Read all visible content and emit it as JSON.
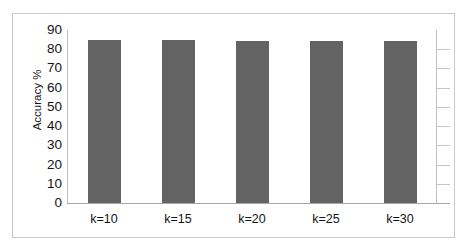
{
  "chart_data": {
    "type": "bar",
    "title": "",
    "xlabel": "",
    "ylabel": "Accuracy %",
    "categories": [
      "k=10",
      "k=15",
      "k=20",
      "k=25",
      "k=30"
    ],
    "values": [
      84.7,
      84.6,
      84.5,
      84.5,
      84.4
    ],
    "ylim": [
      0,
      90
    ],
    "ytick_labels": [
      "90",
      "80",
      "70",
      "60",
      "50",
      "40",
      "30",
      "20",
      "10",
      "0"
    ],
    "ytick_values": [
      90,
      80,
      70,
      60,
      50,
      40,
      30,
      20,
      10,
      0
    ],
    "ytick_step": 10,
    "grid": true,
    "grid_axis": "y",
    "legend": false,
    "legend_position": "none",
    "series": [
      {
        "name": "Accuracy",
        "values": [
          84.7,
          84.6,
          84.5,
          84.5,
          84.4
        ]
      }
    ],
    "colors": {
      "bar_fill": "#636363",
      "gridline": "#c4c4c4",
      "axis_line": "#a8a8a8",
      "plot_border": "#bfbfbf",
      "figure_border": "#c9c9c9",
      "text": "#141414",
      "background": "#ffffff"
    }
  }
}
